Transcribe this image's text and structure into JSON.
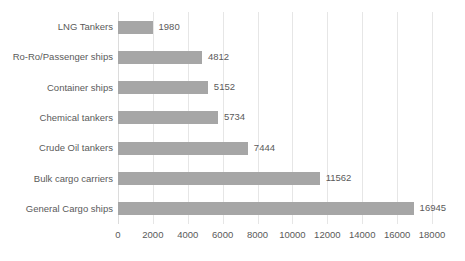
{
  "chart_data": {
    "type": "bar",
    "orientation": "horizontal",
    "title": "",
    "subtitle": "",
    "xlabel": "",
    "ylabel": "",
    "categories": [
      "LNG Tankers",
      "Ro-Ro/Passenger ships",
      "Container ships",
      "Chemical tankers",
      "Crude Oil tankers",
      "Bulk cargo carriers",
      "General Cargo ships"
    ],
    "values": [
      1980,
      4812,
      5152,
      5734,
      7444,
      11562,
      16945
    ],
    "data_labels": [
      "1980",
      "4812",
      "5152",
      "5734",
      "7444",
      "11562",
      "16945"
    ],
    "xlim": [
      0,
      18000
    ],
    "xticks": [
      0,
      2000,
      4000,
      6000,
      8000,
      10000,
      12000,
      14000,
      16000,
      18000
    ],
    "xtick_labels": [
      "0",
      "2000",
      "4000",
      "6000",
      "8000",
      "10000",
      "12000",
      "14000",
      "16000",
      "18000"
    ],
    "grid": {
      "vertical": true,
      "horizontal": false
    },
    "legend": {
      "visible": false,
      "position": "none"
    },
    "colors": {
      "bar": "#a6a6a6",
      "gridline": "#e6e6e6",
      "text": "#5a5a5a",
      "background": "#ffffff"
    }
  }
}
